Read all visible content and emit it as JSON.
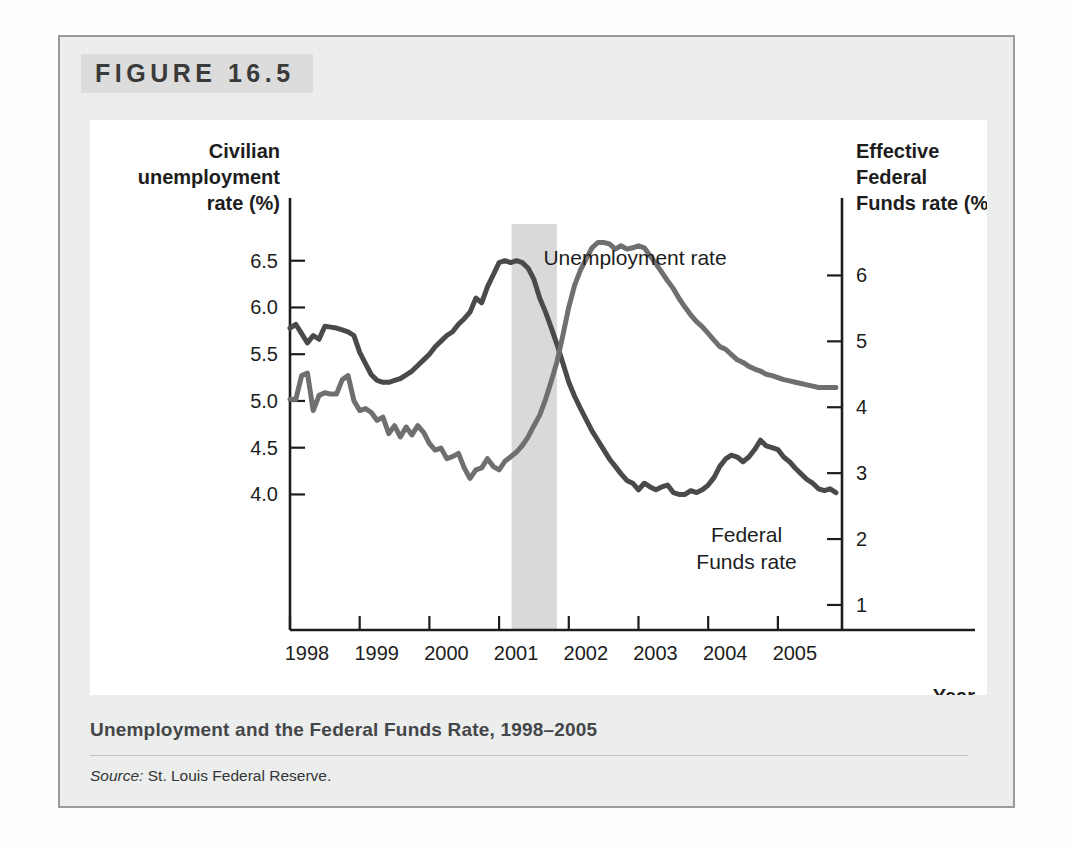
{
  "figure": {
    "number_label": "FIGURE 16.5",
    "caption": "Unemployment and the Federal Funds Rate, 1998–2005",
    "source_label": "Source:",
    "source_text": "St. Louis Federal Reserve."
  },
  "chart_data": {
    "type": "line",
    "title": "Unemployment and the Federal Funds Rate, 1998–2005",
    "xlabel": "Year",
    "left_axis": {
      "label": "Civilian unemployment rate (%)",
      "label_lines": [
        "Civilian",
        "unemployment",
        "rate (%)"
      ],
      "ticks": [
        6.5,
        6.0,
        5.5,
        5.0,
        4.5,
        4.0
      ],
      "tick_labels": [
        "6.5",
        "6.0",
        "5.5",
        "5.0",
        "4.5",
        "4.0"
      ],
      "ylim": [
        2.55,
        6.85
      ]
    },
    "right_axis": {
      "label": "Effective Federal Funds rate (%)",
      "label_lines": [
        "Effective",
        "Federal",
        "Funds rate (%)"
      ],
      "ticks": [
        6,
        5,
        4,
        3,
        2,
        1
      ],
      "tick_labels": [
        "6",
        "5",
        "4",
        "3",
        "2",
        "1"
      ],
      "ylim": [
        0.62,
        6.72
      ]
    },
    "xlim": [
      1998.0,
      2005.92
    ],
    "xticks": [
      1998,
      1999,
      2000,
      2001,
      2002,
      2003,
      2004,
      2005
    ],
    "xtick_labels": [
      "1998",
      "1999",
      "2000",
      "2001",
      "2002",
      "2003",
      "2004",
      "2005"
    ],
    "grid": false,
    "legend_position": "inline-annotations",
    "annotations": [
      {
        "name": "unemployment-rate-label",
        "text": "Unemployment rate",
        "lines": [
          "Unemployment rate"
        ],
        "x": 2002.95,
        "y_left": 6.45
      },
      {
        "name": "federal-funds-rate-label",
        "text": "Federal Funds rate",
        "lines": [
          "Federal",
          "Funds rate"
        ],
        "x": 2004.55,
        "y_right": 1.95
      }
    ],
    "shaded_region": {
      "name": "recession-band",
      "x_start": 2001.18,
      "x_end": 2001.83,
      "color": "#d9d9d9"
    },
    "series": [
      {
        "name": "Unemployment rate",
        "axis": "left",
        "color": "#4a4a4a",
        "x": [
          1998.0,
          1998.083,
          1998.167,
          1998.25,
          1998.333,
          1998.417,
          1998.5,
          1998.583,
          1998.667,
          1998.75,
          1998.833,
          1998.917,
          1999.0,
          1999.083,
          1999.167,
          1999.25,
          1999.333,
          1999.417,
          1999.5,
          1999.583,
          1999.667,
          1999.75,
          1999.833,
          1999.917,
          2000.0,
          2000.083,
          2000.167,
          2000.25,
          2000.333,
          2000.417,
          2000.5,
          2000.583,
          2000.667,
          2000.75,
          2000.833,
          2000.917,
          2001.0,
          2001.083,
          2001.167,
          2001.25,
          2001.333,
          2001.417,
          2001.5,
          2001.583,
          2001.667,
          2001.75,
          2001.833,
          2001.917,
          2002.0,
          2002.083,
          2002.167,
          2002.25,
          2002.333,
          2002.417,
          2002.5,
          2002.583,
          2002.667,
          2002.75,
          2002.833,
          2002.917,
          2003.0,
          2003.083,
          2003.167,
          2003.25,
          2003.333,
          2003.417,
          2003.5,
          2003.583,
          2003.667,
          2003.75,
          2003.833,
          2003.917,
          2004.0,
          2004.083,
          2004.167,
          2004.25,
          2004.333,
          2004.417,
          2004.5,
          2004.583,
          2004.667,
          2004.75,
          2004.833,
          2004.917,
          2005.0,
          2005.083,
          2005.167,
          2005.25,
          2005.333,
          2005.417,
          2005.5,
          2005.583,
          2005.667,
          2005.75,
          2005.833
        ],
        "y": [
          5.78,
          5.82,
          5.72,
          5.62,
          5.7,
          5.66,
          5.8,
          5.79,
          5.78,
          5.76,
          5.74,
          5.7,
          5.52,
          5.4,
          5.28,
          5.22,
          5.2,
          5.2,
          5.22,
          5.24,
          5.28,
          5.32,
          5.38,
          5.44,
          5.5,
          5.58,
          5.64,
          5.7,
          5.74,
          5.82,
          5.88,
          5.95,
          6.1,
          6.05,
          6.22,
          6.35,
          6.48,
          6.5,
          6.48,
          6.5,
          6.48,
          6.42,
          6.3,
          6.1,
          5.95,
          5.78,
          5.6,
          5.4,
          5.2,
          5.05,
          4.92,
          4.8,
          4.68,
          4.58,
          4.48,
          4.38,
          4.3,
          4.22,
          4.15,
          4.12,
          4.05,
          4.12,
          4.08,
          4.05,
          4.08,
          4.1,
          4.02,
          4.0,
          4.0,
          4.04,
          4.02,
          4.05,
          4.1,
          4.18,
          4.3,
          4.38,
          4.42,
          4.4,
          4.35,
          4.4,
          4.48,
          4.58,
          4.52,
          4.5,
          4.48,
          4.4,
          4.35,
          4.28,
          4.22,
          4.16,
          4.12,
          4.06,
          4.04,
          4.06,
          4.02
        ],
        "note": "drawn in plot coordinates as unemployment path"
      },
      {
        "name": "Federal Funds rate",
        "axis": "right",
        "color": "#6f6f6f",
        "x": [
          1998.0,
          1998.083,
          1998.167,
          1998.25,
          1998.333,
          1998.417,
          1998.5,
          1998.583,
          1998.667,
          1998.75,
          1998.833,
          1998.917,
          1999.0,
          1999.083,
          1999.167,
          1999.25,
          1999.333,
          1999.417,
          1999.5,
          1999.583,
          1999.667,
          1999.75,
          1999.833,
          1999.917,
          2000.0,
          2000.083,
          2000.167,
          2000.25,
          2000.333,
          2000.417,
          2000.5,
          2000.583,
          2000.667,
          2000.75,
          2000.833,
          2000.917,
          2001.0,
          2001.083,
          2001.167,
          2001.25,
          2001.333,
          2001.417,
          2001.5,
          2001.583,
          2001.667,
          2001.75,
          2001.833,
          2001.917,
          2002.0,
          2002.083,
          2002.167,
          2002.25,
          2002.333,
          2002.417,
          2002.5,
          2002.583,
          2002.667,
          2002.75,
          2002.833,
          2002.917,
          2003.0,
          2003.083,
          2003.167,
          2003.25,
          2003.333,
          2003.417,
          2003.5,
          2003.583,
          2003.667,
          2003.75,
          2003.833,
          2003.917,
          2004.0,
          2004.083,
          2004.167,
          2004.25,
          2004.333,
          2004.417,
          2004.5,
          2004.583,
          2004.667,
          2004.75,
          2004.833,
          2004.917,
          2005.0,
          2005.083,
          2005.167,
          2005.25,
          2005.333,
          2005.417,
          2005.5,
          2005.583,
          2005.667,
          2005.75,
          2005.833
        ],
        "y": [
          4.12,
          4.12,
          4.48,
          4.52,
          3.95,
          4.18,
          4.22,
          4.2,
          4.2,
          4.42,
          4.48,
          4.1,
          3.95,
          3.98,
          3.92,
          3.8,
          3.85,
          3.6,
          3.72,
          3.55,
          3.7,
          3.58,
          3.72,
          3.62,
          3.45,
          3.35,
          3.38,
          3.22,
          3.25,
          3.3,
          3.08,
          2.92,
          3.05,
          3.08,
          3.22,
          3.1,
          3.05,
          3.18,
          3.25,
          3.32,
          3.42,
          3.55,
          3.72,
          3.88,
          4.12,
          4.4,
          4.7,
          5.1,
          5.52,
          5.85,
          6.08,
          6.25,
          6.42,
          6.5,
          6.5,
          6.48,
          6.4,
          6.45,
          6.4,
          6.42,
          6.45,
          6.42,
          6.3,
          6.18,
          6.05,
          5.92,
          5.8,
          5.65,
          5.52,
          5.4,
          5.3,
          5.22,
          5.12,
          5.02,
          4.92,
          4.88,
          4.8,
          4.72,
          4.68,
          4.62,
          4.58,
          4.55,
          4.5,
          4.48,
          4.45,
          4.42,
          4.4,
          4.38,
          4.36,
          4.34,
          4.32,
          4.3,
          4.3,
          4.3,
          4.3
        ],
        "note": "plotted on right scale"
      }
    ],
    "series_values_right_scale": {
      "Federal Funds rate": {
        "description": "Effective federal funds rate read on right axis",
        "1998_start": 5.5,
        "1999_low": 4.7,
        "2000_mid": 6.5,
        "2001_start": 5.98,
        "2001_end": 1.82,
        "2002_end": 1.24,
        "2003_to_2004_mid": 1.0,
        "2005_end": 4.15
      }
    },
    "series_values_left_scale": {
      "Unemployment rate": {
        "description": "Civilian unemployment rate read on left axis",
        "1998_start": 5.8,
        "1999_low": 5.2,
        "2000_peak": 6.5,
        "2001_end": 5.7,
        "2003_peak": 6.3,
        "2005_end": 4.95
      }
    }
  }
}
